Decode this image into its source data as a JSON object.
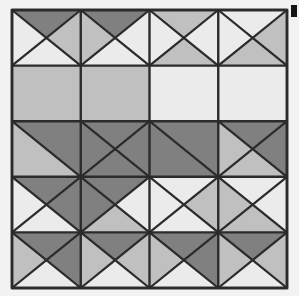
{
  "figure": {
    "kind": "geometric-tiling",
    "width": 299,
    "height": 296
  },
  "colors": {
    "background": "#f2f2f2",
    "light": "#ebebeb",
    "medium": "#c0c0c0",
    "dark": "#808080",
    "stroke": "#2b2b2b",
    "marker": "#141414"
  },
  "grid": {
    "left": 12,
    "top": 10,
    "right": 287,
    "bottom": 288,
    "columns": 4,
    "rows": 5,
    "column_edges": [
      12,
      80.75,
      149.5,
      218.25,
      287
    ],
    "row_edges": [
      10,
      65.6,
      121.2,
      176.8,
      232.4,
      288
    ],
    "stroke_width": 2.2
  },
  "corner_marker": {
    "name": "top-right-black-swatch",
    "x": 291,
    "y": 5,
    "width": 6,
    "height": 12,
    "color": "#141414"
  },
  "chart_data": {
    "type": "heatmap",
    "xlabel": "",
    "ylabel": "",
    "grid": true,
    "legend": null,
    "columns": 4,
    "rows": 5,
    "shade_levels": {
      "light": "#ebebeb",
      "medium": "#c0c0c0",
      "dark": "#808080"
    },
    "bands": [
      {
        "row": 0,
        "style": "double-diagonal-X",
        "span": 2,
        "cells": [
          {
            "col": 0,
            "top": "dark",
            "left": "light",
            "bottom": "light",
            "right": "medium"
          },
          {
            "col": 1,
            "top": "dark",
            "left": "medium",
            "bottom": "light",
            "right": "light"
          },
          {
            "col": 2,
            "top": "medium",
            "left": "light",
            "bottom": "medium",
            "right": "light"
          },
          {
            "col": 3,
            "top": "light",
            "left": "light",
            "bottom": "medium",
            "right": "medium"
          }
        ]
      },
      {
        "row": 1,
        "style": "plain",
        "span": 1,
        "cells": [
          {
            "col": 0,
            "fill": "medium"
          },
          {
            "col": 1,
            "fill": "medium"
          },
          {
            "col": 2,
            "fill": "light"
          },
          {
            "col": 3,
            "fill": "light"
          }
        ]
      },
      {
        "row": 2,
        "style": "long-diagonal",
        "span": 2,
        "cells": [
          {
            "col": 0,
            "top": "dark",
            "bottom": "medium"
          },
          {
            "col": 1,
            "top": "dark",
            "bottom": "dark"
          },
          {
            "col": 2,
            "top": "dark",
            "bottom": "dark"
          },
          {
            "col": 3,
            "top": "dark",
            "bottom": "medium"
          }
        ]
      },
      {
        "row": 3,
        "style": "double-diagonal-X",
        "span": 2,
        "cells": [
          {
            "col": 0,
            "top": "dark",
            "left": "light",
            "bottom": "light",
            "right": "dark"
          },
          {
            "col": 1,
            "top": "dark",
            "left": "dark",
            "bottom": "medium",
            "right": "light"
          },
          {
            "col": 2,
            "top": "light",
            "left": "light",
            "bottom": "light",
            "right": "medium"
          },
          {
            "col": 3,
            "top": "light",
            "left": "medium",
            "bottom": "medium",
            "right": "light"
          }
        ]
      },
      {
        "row": 4,
        "style": "double-diagonal-X",
        "span": 2,
        "cells": [
          {
            "col": 0,
            "top": "dark",
            "left": "medium",
            "bottom": "light",
            "right": "dark"
          },
          {
            "col": 1,
            "top": "dark",
            "left": "medium",
            "bottom": "light",
            "right": "medium"
          },
          {
            "col": 2,
            "top": "dark",
            "left": "medium",
            "bottom": "light",
            "right": "dark"
          },
          {
            "col": 3,
            "top": "dark",
            "left": "medium",
            "bottom": "light",
            "right": "medium"
          }
        ]
      }
    ]
  }
}
